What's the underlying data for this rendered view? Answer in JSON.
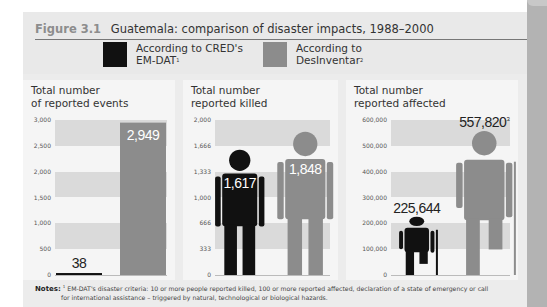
{
  "figure": {
    "number": "Figure 3.1",
    "title": "Guatemala: comparison of disaster impacts, 1988–2000"
  },
  "legend": [
    {
      "label_line1": "According to CRED's",
      "label_line2": "EM-DAT",
      "sup": "1",
      "color": "#111111"
    },
    {
      "label_line1": "According to",
      "label_line2": "DesInventar",
      "sup": "2",
      "color": "#8c8c8c"
    }
  ],
  "notes": {
    "label": "Notes:",
    "sup": "1",
    "line1": "EM-DAT's disaster criteria: 10 or more people reported killed, 100 or more reported affected, declaration of a state of emergency or call",
    "line2": "for international assistance – triggered by natural, technological or biological hazards."
  },
  "chart_data": [
    {
      "type": "bar",
      "title": "Total number of reported events",
      "title_line1": "Total number",
      "title_line2": "of reported events",
      "categories": [
        "EM-DAT",
        "DesInventar"
      ],
      "values": [
        38,
        2949
      ],
      "value_labels": [
        "38",
        "2,949"
      ],
      "yticks": [
        "3,000",
        "2,500",
        "2,000",
        "1,500",
        "1,000",
        "500",
        "0"
      ],
      "ylim": [
        0,
        3000
      ],
      "bands": true
    },
    {
      "type": "bar",
      "title": "Total number reported killed",
      "title_line1": "Total number",
      "title_line2": "reported killed",
      "categories": [
        "EM-DAT",
        "DesInventar"
      ],
      "values": [
        1617,
        1848
      ],
      "value_labels": [
        "1,617",
        "1,848"
      ],
      "yticks": [
        "2,000",
        "1,666",
        "1,333",
        "1,000",
        "666",
        "333",
        "0"
      ],
      "ylim": [
        0,
        2000
      ],
      "marker": "standing-person"
    },
    {
      "type": "bar",
      "title": "Total number reported affected",
      "title_line1": "Total number",
      "title_line2": "reported affected",
      "categories": [
        "EM-DAT",
        "DesInventar"
      ],
      "values": [
        225644,
        557820
      ],
      "value_labels": [
        "225,644",
        "557,820"
      ],
      "value_label_sups": [
        "",
        "3"
      ],
      "yticks": [
        "600,000",
        "500,000",
        "400,000",
        "300,000",
        "200,000",
        "100,000",
        "0"
      ],
      "ylim": [
        0,
        600000
      ],
      "marker": "person-with-crutch"
    }
  ]
}
